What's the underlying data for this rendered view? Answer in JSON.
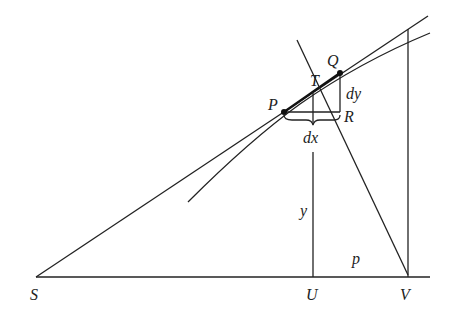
{
  "figure": {
    "points": {
      "S": "S",
      "U": "U",
      "V": "V",
      "P": "P",
      "Q": "Q",
      "T": "T",
      "R": "R"
    },
    "quantities": {
      "dx": "dx",
      "dy": "dy",
      "y": "y",
      "p": "p"
    }
  }
}
